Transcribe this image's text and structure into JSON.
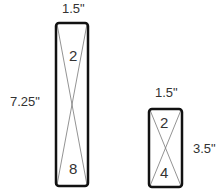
{
  "diagram": {
    "tall_panel": {
      "width_label": "1.5\"",
      "height_label": "7.25\"",
      "top_number": "2",
      "bottom_number": "8"
    },
    "short_panel": {
      "width_label": "1.5\"",
      "height_label": "3.5\"",
      "top_number": "2",
      "bottom_number": "4"
    },
    "colors": {
      "outline": "#111111",
      "cross_lines": "#777777",
      "text": "#333333"
    }
  }
}
